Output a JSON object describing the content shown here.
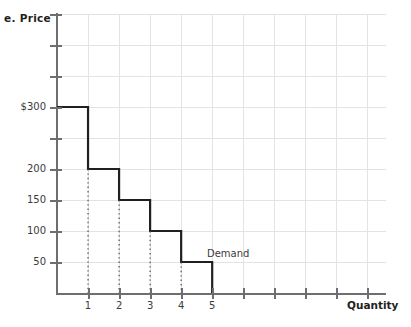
{
  "figure": {
    "part_letter": "e.",
    "y_axis_title": "Price",
    "x_axis_title": "Quantity"
  },
  "annotations": {
    "demand_label": "Demand"
  },
  "colors": {
    "curve": "#231f20",
    "axis": "#6d6e71",
    "grid": "#e3e3e3",
    "text": "#231f20",
    "dropline": "#4d4d4d"
  },
  "chart_data": {
    "type": "line",
    "title": "",
    "subtitle": "",
    "xlabel": "Quantity",
    "ylabel": "Price",
    "step": "post",
    "grid": true,
    "legend": false,
    "series": [
      {
        "name": "Demand",
        "style": "step",
        "quantities": [
          1,
          2,
          3,
          4,
          5
        ],
        "prices": [
          300,
          200,
          150,
          100,
          50
        ],
        "points": [
          {
            "quantity": 1,
            "price": 300
          },
          {
            "quantity": 2,
            "price": 200
          },
          {
            "quantity": 3,
            "price": 150
          },
          {
            "quantity": 4,
            "price": 100
          },
          {
            "quantity": 5,
            "price": 50
          }
        ]
      }
    ],
    "droplines_at_quantity": [
      1,
      2,
      3,
      4
    ],
    "xlim": [
      0,
      10.6
    ],
    "ylim": [
      0,
      450
    ],
    "x_ticks": [
      1,
      2,
      3,
      4,
      5,
      6,
      7,
      8,
      9,
      10
    ],
    "x_tick_labels": [
      "1",
      "2",
      "3",
      "4",
      "5",
      "",
      "",
      "",
      "",
      ""
    ],
    "y_ticks": [
      50,
      100,
      150,
      200,
      250,
      300,
      350,
      400,
      450
    ],
    "y_tick_labels": [
      "50",
      "100",
      "150",
      "200",
      "",
      "$300",
      "",
      "",
      ""
    ]
  }
}
